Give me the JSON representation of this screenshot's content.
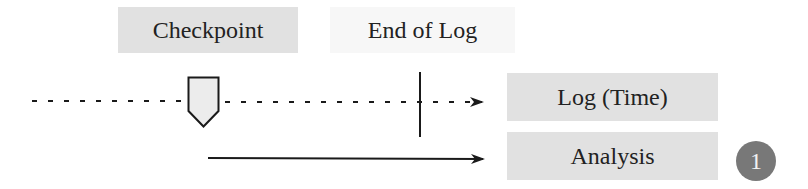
{
  "labels": {
    "checkpoint": "Checkpoint",
    "end_of_log": "End of Log",
    "log_time": "Log (Time)",
    "analysis": "Analysis"
  },
  "badge": {
    "number": "1",
    "color": "#787878",
    "text_color": "#f2f2f2"
  },
  "colors": {
    "box_fill": "#e1e1e1",
    "line": "#1a1a1a",
    "marker_fill": "#ececec"
  }
}
